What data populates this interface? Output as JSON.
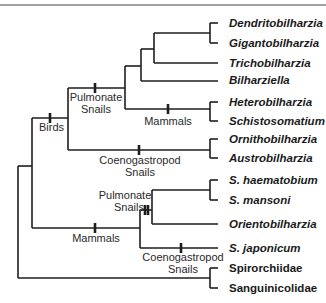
{
  "diagram": {
    "type": "phylogenetic-tree",
    "taxa": [
      {
        "name": "Dendritobilharzia",
        "italic": true
      },
      {
        "name": "Gigantobilharzia",
        "italic": true
      },
      {
        "name": "Trichobilharzia",
        "italic": true
      },
      {
        "name": "Bilharziella",
        "italic": true
      },
      {
        "name": "Heterobilharzia",
        "italic": true
      },
      {
        "name": "Schistosomatium",
        "italic": true
      },
      {
        "name": "Ornithobilharzia",
        "italic": true
      },
      {
        "name": "Austrobilharzia",
        "italic": true
      },
      {
        "name": "S. haematobium",
        "italic": true
      },
      {
        "name": "S. mansoni",
        "italic": true
      },
      {
        "name": "Orientobilharzia",
        "italic": true
      },
      {
        "name": "S. japonicum",
        "italic": true
      },
      {
        "name": "Spirorchiidae",
        "italic": false
      },
      {
        "name": "Sanguinicolidae",
        "italic": false
      }
    ],
    "host_labels": {
      "birds": "Birds",
      "pulmonate_upper_line1": "Pulmonate",
      "pulmonate_upper_line2": "Snails",
      "mammals_upper": "Mammals",
      "coeno_upper_line1": "Coenogastropod",
      "coeno_upper_line2": "Snails",
      "pulmonate_lower_line1": "Pulmonate",
      "pulmonate_lower_line2": "Snails",
      "mammals_lower": "Mammals",
      "coeno_lower_line1": "Coenogastropod",
      "coeno_lower_line2": "Snails"
    }
  }
}
